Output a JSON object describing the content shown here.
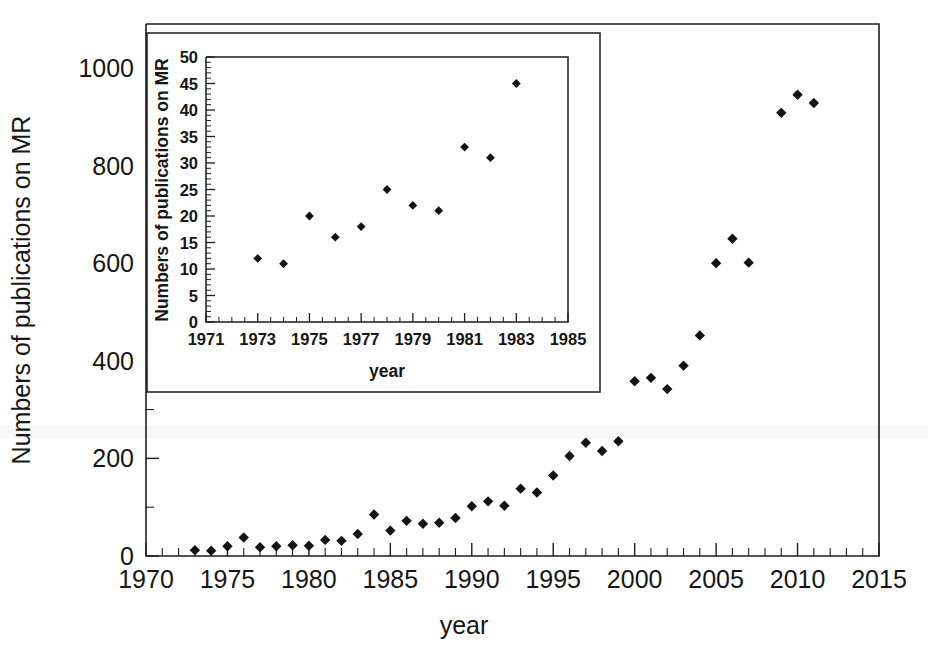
{
  "figure": {
    "name": "publications-on-mr-over-time",
    "background_color": "#ffffff",
    "ink_color": "#1d1d1d"
  },
  "main_axes": {
    "xlabel": "year",
    "ylabel": "Numbers of publications on MR",
    "x_ticks": [
      "1970",
      "1975",
      "1980",
      "1985",
      "1990",
      "1995",
      "2000",
      "2005",
      "2010",
      "2015"
    ],
    "y_ticks": [
      "0",
      "200",
      "400",
      "600",
      "800",
      "1000"
    ]
  },
  "inset_axes": {
    "xlabel": "year",
    "ylabel": "Numbers of publications on MR",
    "x_ticks": [
      "1971",
      "1973",
      "1975",
      "1977",
      "1979",
      "1981",
      "1983",
      "1985"
    ],
    "y_ticks": [
      "0",
      "5",
      "10",
      "15",
      "20",
      "25",
      "30",
      "35",
      "40",
      "45",
      "50"
    ]
  },
  "chart_data": [
    {
      "id": "main-scatter",
      "type": "scatter",
      "title": "",
      "xlabel": "year",
      "ylabel": "Numbers of publications on MR",
      "xlim": [
        1970,
        2015
      ],
      "ylim": [
        0,
        1090
      ],
      "x_major_tick_step": 5,
      "x_minor_tick_step": 1,
      "y_major_tick_step": 200,
      "y_minor_tick_step": 100,
      "grid": false,
      "legend": null,
      "marker": "diamond",
      "marker_color": "#121212",
      "x": [
        1973,
        1974,
        1975,
        1976,
        1977,
        1978,
        1979,
        1980,
        1981,
        1982,
        1983,
        1984,
        1985,
        1986,
        1987,
        1988,
        1989,
        1990,
        1991,
        1992,
        1993,
        1994,
        1995,
        1996,
        1997,
        1998,
        1999,
        2000,
        2001,
        2002,
        2003,
        2004,
        2005,
        2006,
        2007,
        2009,
        2010,
        2011
      ],
      "y": [
        12,
        11,
        20,
        38,
        18,
        20,
        22,
        21,
        33,
        31,
        45,
        85,
        52,
        72,
        66,
        68,
        78,
        102,
        112,
        103,
        138,
        130,
        165,
        205,
        232,
        215,
        235,
        358,
        365,
        342,
        390,
        452,
        600,
        650,
        601,
        908,
        945,
        928
      ],
      "points": [
        {
          "year": 1973,
          "value": 12
        },
        {
          "year": 1974,
          "value": 11
        },
        {
          "year": 1975,
          "value": 20
        },
        {
          "year": 1976,
          "value": 38
        },
        {
          "year": 1977,
          "value": 18
        },
        {
          "year": 1978,
          "value": 20
        },
        {
          "year": 1979,
          "value": 22
        },
        {
          "year": 1980,
          "value": 21
        },
        {
          "year": 1981,
          "value": 33
        },
        {
          "year": 1982,
          "value": 31
        },
        {
          "year": 1983,
          "value": 45
        },
        {
          "year": 1984,
          "value": 85
        },
        {
          "year": 1985,
          "value": 52
        },
        {
          "year": 1986,
          "value": 72
        },
        {
          "year": 1987,
          "value": 66
        },
        {
          "year": 1988,
          "value": 68
        },
        {
          "year": 1989,
          "value": 78
        },
        {
          "year": 1990,
          "value": 102
        },
        {
          "year": 1991,
          "value": 112
        },
        {
          "year": 1992,
          "value": 103
        },
        {
          "year": 1993,
          "value": 138
        },
        {
          "year": 1994,
          "value": 130
        },
        {
          "year": 1995,
          "value": 165
        },
        {
          "year": 1996,
          "value": 205
        },
        {
          "year": 1997,
          "value": 232
        },
        {
          "year": 1998,
          "value": 215
        },
        {
          "year": 1999,
          "value": 235
        },
        {
          "year": 2000,
          "value": 358
        },
        {
          "year": 2001,
          "value": 365
        },
        {
          "year": 2002,
          "value": 342
        },
        {
          "year": 2003,
          "value": 390
        },
        {
          "year": 2004,
          "value": 452
        },
        {
          "year": 2005,
          "value": 600
        },
        {
          "year": 2006,
          "value": 650
        },
        {
          "year": 2007,
          "value": 601
        },
        {
          "year": 2009,
          "value": 908
        },
        {
          "year": 2010,
          "value": 945
        },
        {
          "year": 2011,
          "value": 928
        }
      ]
    },
    {
      "id": "inset-scatter",
      "type": "scatter",
      "title": "",
      "xlabel": "year",
      "ylabel": "Numbers of publications on MR",
      "xlim": [
        1971,
        1985
      ],
      "ylim": [
        0,
        50
      ],
      "x_major_tick_step": 2,
      "x_minor_tick_step": 0.5,
      "y_major_tick_step": 5,
      "y_minor_tick_step": 1,
      "grid": false,
      "legend": null,
      "marker": "diamond",
      "marker_color": "#121212",
      "x": [
        1973,
        1974,
        1975,
        1976,
        1977,
        1978,
        1979,
        1980,
        1981,
        1982,
        1983
      ],
      "y": [
        12,
        11,
        20,
        16,
        18,
        25,
        22,
        21,
        33,
        31,
        45
      ],
      "points": [
        {
          "year": 1973,
          "value": 12
        },
        {
          "year": 1974,
          "value": 11
        },
        {
          "year": 1975,
          "value": 20
        },
        {
          "year": 1976,
          "value": 16
        },
        {
          "year": 1977,
          "value": 18
        },
        {
          "year": 1978,
          "value": 25
        },
        {
          "year": 1979,
          "value": 22
        },
        {
          "year": 1980,
          "value": 21
        },
        {
          "year": 1981,
          "value": 33
        },
        {
          "year": 1982,
          "value": 31
        },
        {
          "year": 1983,
          "value": 45
        }
      ]
    }
  ]
}
